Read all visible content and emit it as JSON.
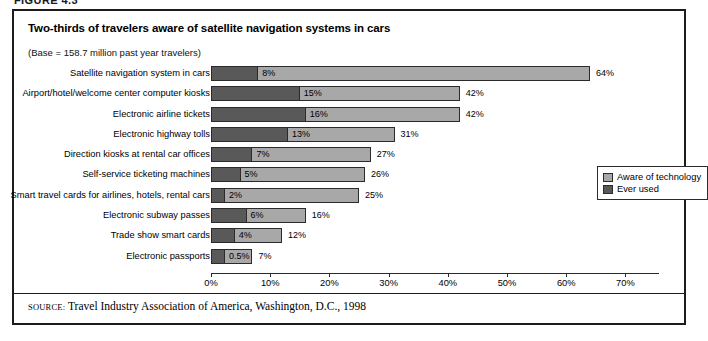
{
  "figure": {
    "caption": "FIGURE 4.3"
  },
  "chart_data": {
    "type": "bar",
    "orientation": "horizontal",
    "title": "Two-thirds of travelers aware of satellite navigation systems in cars",
    "subtitle": "(Base = 158.7 million past year travelers)",
    "xlabel": "",
    "ylabel": "",
    "xlim": [
      0,
      75
    ],
    "grid": false,
    "legend_position": "right",
    "categories": [
      "Satellite navigation system in cars",
      "Airport/hotel/welcome center computer kiosks",
      "Electronic airline tickets",
      "Electronic highway tolls",
      "Direction kiosks at rental car offices",
      "Self-service ticketing machines",
      "Smart travel cards for airlines, hotels, rental cars",
      "Electronic subway passes",
      "Trade show smart cards",
      "Electronic passports"
    ],
    "series": [
      {
        "name": "Aware of technology",
        "color": "#a8a8a8",
        "values": [
          64,
          42,
          42,
          31,
          27,
          26,
          25,
          16,
          12,
          7
        ],
        "labels": [
          "64%",
          "42%",
          "42%",
          "31%",
          "27%",
          "26%",
          "25%",
          "16%",
          "12%",
          "7%"
        ]
      },
      {
        "name": "Ever used",
        "color": "#595959",
        "values": [
          8,
          15,
          16,
          13,
          7,
          5,
          2,
          6,
          4,
          0.5
        ],
        "labels": [
          "8%",
          "15%",
          "16%",
          "13%",
          "7%",
          "5%",
          "2%",
          "6%",
          "4%",
          "0.5%"
        ]
      }
    ],
    "ticks": [
      "0%",
      "10%",
      "20%",
      "30%",
      "40%",
      "50%",
      "60%",
      "70%"
    ],
    "tick_values": [
      0,
      10,
      20,
      30,
      40,
      50,
      60,
      70
    ]
  },
  "legend": {
    "items": [
      {
        "label": "Aware of technology"
      },
      {
        "label": "Ever used"
      }
    ]
  },
  "source": {
    "keyword": "SOURCE:",
    "text": "Travel Industry Association of America, Washington, D.C., 1998"
  }
}
